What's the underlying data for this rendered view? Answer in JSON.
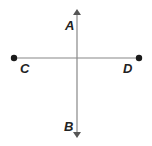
{
  "diagram": {
    "colors": {
      "line": "#888888",
      "point": "#1a1a1a",
      "label": "#222222"
    },
    "line_ab": {
      "type": "line",
      "arrows": "both",
      "labels": [
        "A",
        "B"
      ]
    },
    "segment_cd": {
      "type": "segment",
      "endpoints": [
        "C",
        "D"
      ]
    },
    "labels": {
      "A": "A",
      "B": "B",
      "C": "C",
      "D": "D"
    }
  }
}
